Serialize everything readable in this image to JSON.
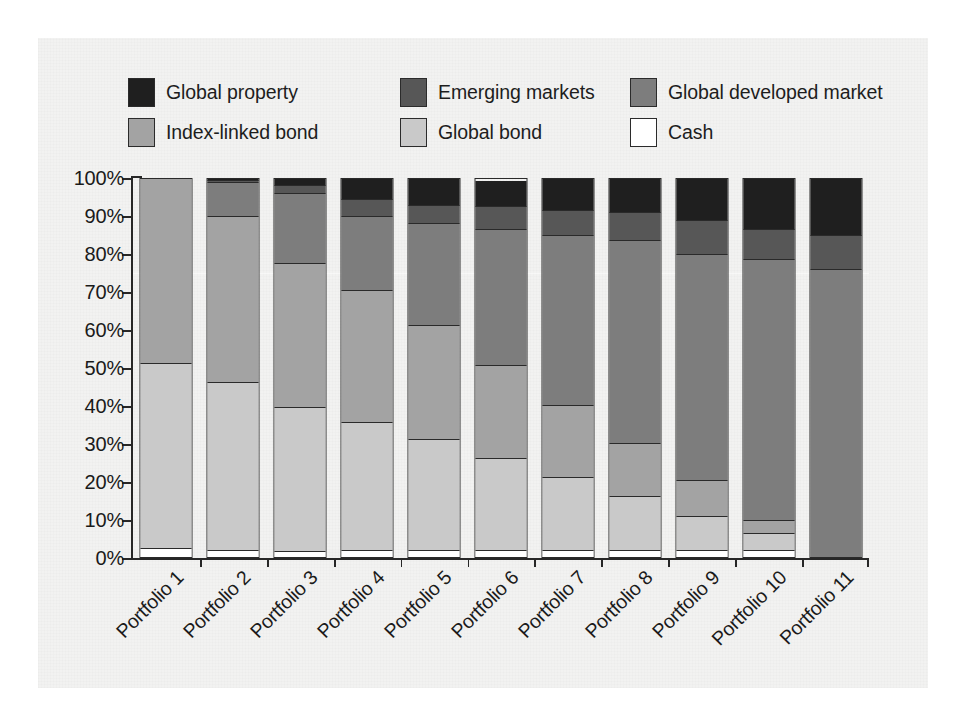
{
  "chart_data": {
    "type": "bar",
    "subtype": "stacked-100-percent",
    "title": "",
    "xlabel": "",
    "ylabel": "",
    "ylim": [
      0,
      100
    ],
    "ytick_labels": [
      "0%",
      "10%",
      "20%",
      "30%",
      "40%",
      "50%",
      "60%",
      "70%",
      "80%",
      "90%",
      "100%"
    ],
    "ytick_values": [
      0,
      10,
      20,
      30,
      40,
      50,
      60,
      70,
      80,
      90,
      100
    ],
    "grid": false,
    "legend_position": "top",
    "categories": [
      "Portfolio 1",
      "Portfolio 2",
      "Portfolio 3",
      "Portfolio 4",
      "Portfolio 5",
      "Portfolio 6",
      "Portfolio 7",
      "Portfolio 8",
      "Portfolio 9",
      "Portfolio 10",
      "Portfolio 11"
    ],
    "series": [
      {
        "name": "Cash",
        "color": "#ffffff",
        "values": [
          2,
          1.5,
          1.5,
          1.5,
          1.5,
          1.5,
          1.5,
          1.5,
          1.5,
          1.5,
          0
        ]
      },
      {
        "name": "Global bond",
        "color": "#c9c9c9",
        "values": [
          49,
          44.5,
          39.5,
          34,
          29.5,
          24.5,
          19.5,
          14.5,
          9,
          4.5,
          0
        ]
      },
      {
        "name": "Index-linked bond",
        "color": "#a3a3a3",
        "values": [
          49,
          44,
          39.5,
          35,
          30,
          24.5,
          19,
          14,
          9.5,
          3.5,
          0
        ]
      },
      {
        "name": "Global developed market",
        "color": "#7d7d7d",
        "values": [
          0,
          9,
          19.5,
          19.5,
          27,
          36,
          45,
          53.5,
          60,
          69,
          76
        ]
      },
      {
        "name": "Emerging markets",
        "color": "#575757",
        "values": [
          0,
          0.5,
          2,
          4.5,
          5,
          6,
          6.5,
          7.5,
          9,
          8,
          9
        ]
      },
      {
        "name": "Global property",
        "color": "#1f1f1f",
        "values": [
          0,
          0.5,
          2,
          5.5,
          7,
          7,
          8.5,
          9,
          11,
          13.5,
          15
        ]
      }
    ]
  },
  "legend": {
    "items": [
      {
        "label": "Global property",
        "color": "#1f1f1f"
      },
      {
        "label": "Emerging markets",
        "color": "#575757"
      },
      {
        "label": "Global developed market",
        "color": "#7d7d7d"
      },
      {
        "label": "Index-linked bond",
        "color": "#a3a3a3"
      },
      {
        "label": "Global bond",
        "color": "#c9c9c9"
      },
      {
        "label": "Cash",
        "color": "#ffffff"
      }
    ]
  },
  "colors": {
    "axis": "#272727",
    "text": "#1a1a1a",
    "panel": "#f2f2f1",
    "background": "#ffffff"
  }
}
